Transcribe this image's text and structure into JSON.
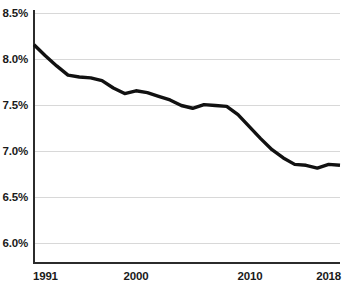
{
  "chart_data": {
    "type": "line",
    "title": "",
    "subtitle": "",
    "xlabel": "",
    "ylabel": "",
    "xlim": [
      1991,
      2018
    ],
    "ylim": [
      5.95,
      8.55
    ],
    "grid": true,
    "legend": null,
    "y_ticks": [
      "8.5%",
      "8.0%",
      "7.5%",
      "7.0%",
      "6.5%",
      "6.0%"
    ],
    "y_tick_values": [
      8.5,
      8.0,
      7.5,
      7.0,
      6.5,
      6.0
    ],
    "x_ticks": [
      "1991",
      "2000",
      "2010",
      "2018"
    ],
    "x_tick_values": [
      1991,
      2000,
      2010,
      2018
    ],
    "x": [
      1991,
      1992,
      1993,
      1994,
      1995,
      1996,
      1997,
      1998,
      1999,
      2000,
      2001,
      2002,
      2003,
      2004,
      2005,
      2006,
      2007,
      2008,
      2009,
      2010,
      2011,
      2012,
      2013,
      2014,
      2015,
      2016,
      2017,
      2018
    ],
    "values": [
      8.16,
      8.04,
      7.93,
      7.83,
      7.81,
      7.8,
      7.77,
      7.69,
      7.63,
      7.66,
      7.64,
      7.6,
      7.56,
      7.5,
      7.47,
      7.51,
      7.5,
      7.49,
      7.4,
      7.27,
      7.14,
      7.02,
      6.93,
      6.86,
      6.85,
      6.82,
      6.86,
      6.85
    ],
    "series": [
      {
        "name": "value",
        "color": "#111111",
        "values": [
          8.16,
          8.04,
          7.93,
          7.83,
          7.81,
          7.8,
          7.77,
          7.69,
          7.63,
          7.66,
          7.64,
          7.6,
          7.56,
          7.5,
          7.47,
          7.51,
          7.5,
          7.49,
          7.4,
          7.27,
          7.14,
          7.02,
          6.93,
          6.86,
          6.85,
          6.82,
          6.86,
          6.85
        ]
      }
    ],
    "colors": {
      "line": "#111111",
      "grid": "#d8d8d8",
      "axis": "#2b2b2b",
      "text": "#1a1a1a",
      "background": "#ffffff"
    }
  }
}
